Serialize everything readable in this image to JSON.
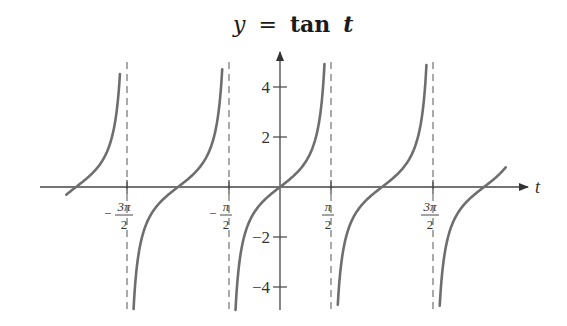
{
  "chart_data": {
    "type": "line",
    "title": "y = tan t",
    "title_parts": {
      "y": "y",
      "eq": "=",
      "fn": "tan",
      "var": "t"
    },
    "xlabel": "t",
    "ylabel": "",
    "function": "tan(t)",
    "xlim": [
      -7.3,
      7.6
    ],
    "ylim": [
      -4.9,
      5.0
    ],
    "grid": false,
    "legend": null,
    "x_ticks": [
      {
        "value": -4.712,
        "label": "-3π/2",
        "sign": "−",
        "num": "3π",
        "den": "2"
      },
      {
        "value": -1.571,
        "label": "-π/2",
        "sign": "−",
        "num": "π",
        "den": "2"
      },
      {
        "value": 1.571,
        "label": "π/2",
        "sign": "",
        "num": "π",
        "den": "2"
      },
      {
        "value": 4.712,
        "label": "3π/2",
        "sign": "",
        "num": "3π",
        "den": "2"
      }
    ],
    "y_ticks": [
      {
        "value": 4,
        "label": "4"
      },
      {
        "value": 2,
        "label": "2"
      },
      {
        "value": -2,
        "label": "−2"
      },
      {
        "value": -4,
        "label": "−4"
      }
    ],
    "asymptotes": [
      -4.712,
      -1.571,
      1.571,
      4.712
    ],
    "series": [
      {
        "name": "tan t",
        "branch_domains": [
          [
            -6.58,
            -4.93
          ],
          [
            -4.51,
            -1.78
          ],
          [
            -1.37,
            1.37
          ],
          [
            1.78,
            4.51
          ],
          [
            4.92,
            6.95
          ]
        ]
      }
    ],
    "colors": {
      "curve": "#6e6e6e",
      "axis": "#444444",
      "asymptote": "#555555"
    }
  }
}
